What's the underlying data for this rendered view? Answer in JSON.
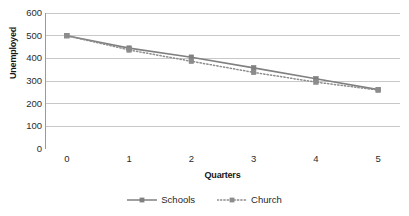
{
  "chart_data": {
    "type": "line",
    "title": "",
    "xlabel": "Quarters",
    "ylabel": "Unemployed",
    "x": [
      0,
      1,
      2,
      3,
      4,
      5
    ],
    "categories": [
      "0",
      "1",
      "2",
      "3",
      "4",
      "5"
    ],
    "series": [
      {
        "name": "Schools",
        "values": [
          500,
          445,
          405,
          358,
          310,
          262
        ],
        "style": "solid",
        "marker": "square",
        "color": "#808080"
      },
      {
        "name": "Church",
        "values": [
          500,
          437,
          387,
          338,
          295,
          260
        ],
        "style": "dotted",
        "marker": "square",
        "color": "#8c8c8c"
      }
    ],
    "xlim": [
      -0.35,
      5.35
    ],
    "ylim": [
      0,
      600
    ],
    "yticks": [
      600,
      500,
      400,
      300,
      200,
      100,
      0
    ],
    "ytick_labels": [
      "600",
      "500",
      "400",
      "300",
      "200",
      "100",
      "0"
    ],
    "grid": "horizontal",
    "legend_position": "bottom",
    "colors": {
      "schools": "#808080",
      "church": "#8c8c8c",
      "gridline": "#c8c8c8",
      "axis": "#9a9a9a",
      "text": "#1a1a1a"
    }
  },
  "legend": {
    "items": [
      {
        "label": "Schools"
      },
      {
        "label": "Church"
      }
    ]
  }
}
